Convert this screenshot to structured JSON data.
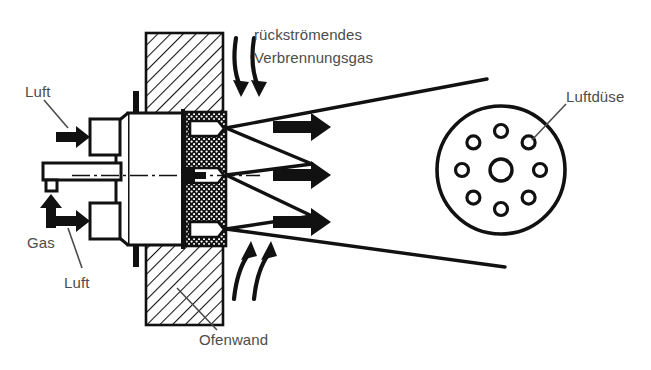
{
  "figure": {
    "background_color": "#ffffff",
    "ink_color": "#111111",
    "label_color": "#4c4c4c",
    "width": 651,
    "height": 370
  },
  "labels": {
    "air_top": "Luft",
    "air_bottom": "Luft",
    "gas": "Gas",
    "recirculating_gas_line1": "rückströmendes",
    "recirculating_gas_line2": "Verbrennungsgas",
    "furnace_wall": "Ofenwand",
    "air_nozzle": "Luftdüse"
  },
  "components": {
    "furnace_wall_name": "Ofenwand (hatched masonry)",
    "burner_body_name": "Brennerkörper",
    "refractory_block_name": "Feuerfestblock (gestippelt)",
    "gas_pipe_name": "Gasrohr",
    "air_inlet_top_name": "Lufteintritt oben",
    "air_inlet_bottom_name": "Lufteintritt unten",
    "flame_cones_count": 3,
    "flow_arrows_count": 3,
    "recirculation_arrows_top": 2,
    "recirculation_arrows_bottom": 2,
    "nozzle_face_holes_outer": 8,
    "nozzle_face_holes_center": 1
  },
  "nozzle_face": {
    "center_x": 501,
    "center_y": 170,
    "radius": 64,
    "center_hole_radius": 11,
    "outer_hole_radius": 6.5,
    "outer_hole_ring_radius": 39
  }
}
